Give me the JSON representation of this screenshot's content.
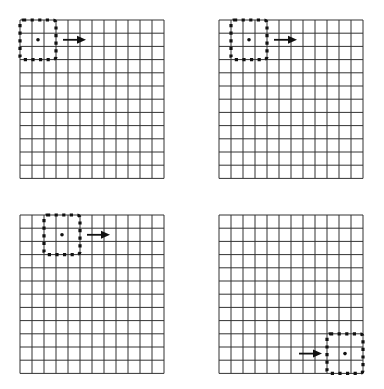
{
  "figure": {
    "grid": {
      "columns": 12,
      "rows": 12,
      "line_color": "#333333",
      "background": "#ffffff"
    },
    "window": {
      "size_cells": 3,
      "border_style": "dotted",
      "color": "#111111",
      "center_marker": "dot"
    },
    "panels": [
      {
        "id": "top-left",
        "x": 20,
        "y": 20,
        "window_col": 0,
        "window_row": 0,
        "arrow": {
          "direction": "right",
          "side": "right-of-window"
        }
      },
      {
        "id": "top-right",
        "x": 219,
        "y": 20,
        "window_col": 1,
        "window_row": 0,
        "arrow": {
          "direction": "right",
          "side": "right-of-window"
        }
      },
      {
        "id": "bottom-left",
        "x": 20,
        "y": 215,
        "window_col": 2,
        "window_row": 0,
        "arrow": {
          "direction": "right",
          "side": "right-of-window"
        }
      },
      {
        "id": "bottom-right",
        "x": 219,
        "y": 215,
        "window_col": 9,
        "window_row": 9,
        "arrow": {
          "direction": "right",
          "side": "left-of-window"
        }
      }
    ]
  }
}
